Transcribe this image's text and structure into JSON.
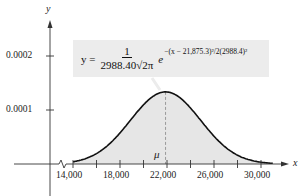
{
  "chart_data": {
    "type": "area",
    "title": "",
    "equation": {
      "lhs": "y =",
      "numerator": "1",
      "denominator": "2988.40√2π",
      "base": "e",
      "exponent": "−(x − 21,875.3)²/2(2988.4)²"
    },
    "mean_label": "μ",
    "mean": 21875.3,
    "std_dev": 2988.4,
    "xlabel": "x",
    "ylabel": "y",
    "x_tick_labels": [
      "14,000",
      "18,000",
      "22,000",
      "26,000",
      "30,000"
    ],
    "x_ticks": [
      14000,
      16000,
      18000,
      20000,
      22000,
      24000,
      26000,
      28000,
      30000
    ],
    "y_tick_labels": [
      "0.0001",
      "0.0002"
    ],
    "y_ticks": [
      0.0001,
      0.0002
    ],
    "xlim": [
      14000,
      31000
    ],
    "ylim": [
      0,
      0.00025
    ],
    "x_axis_break": true,
    "shaded_region": [
      14000,
      31000
    ],
    "peak_value": 0.0001335,
    "grid": false,
    "legend": false,
    "colors": {
      "curve": "#111111",
      "fill": "#e6e6e6",
      "axis": "#333333",
      "box": "#ececec"
    }
  }
}
